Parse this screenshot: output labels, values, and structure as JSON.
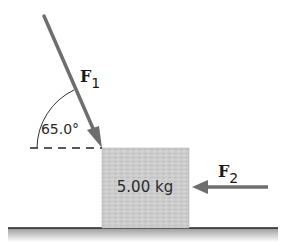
{
  "diagram": {
    "force1": {
      "symbol": "F",
      "subscript": "1",
      "angle_label": "65.0°"
    },
    "force2": {
      "symbol": "F",
      "subscript": "2"
    },
    "block": {
      "mass_label": "5.00 kg"
    }
  },
  "colors": {
    "arrow": "#6e6e6e",
    "block_fill": "#cfcfcf",
    "ground_line": "#222222",
    "ground_fill": "#a8a8a8",
    "text": "#1a1a1a"
  }
}
